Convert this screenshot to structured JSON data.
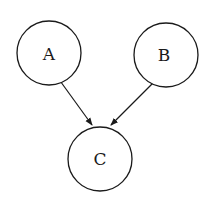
{
  "diagram": {
    "type": "directed-graph",
    "nodes": [
      {
        "id": "A",
        "label": "A",
        "cx": 49,
        "cy": 53,
        "r": 32
      },
      {
        "id": "B",
        "label": "B",
        "cx": 166,
        "cy": 55,
        "r": 32
      },
      {
        "id": "C",
        "label": "C",
        "cx": 100,
        "cy": 159,
        "r": 32
      }
    ],
    "edges": [
      {
        "from": "A",
        "to": "C"
      },
      {
        "from": "B",
        "to": "C"
      }
    ],
    "colors": {
      "stroke": "#1a1a1a",
      "background": "#ffffff"
    }
  }
}
